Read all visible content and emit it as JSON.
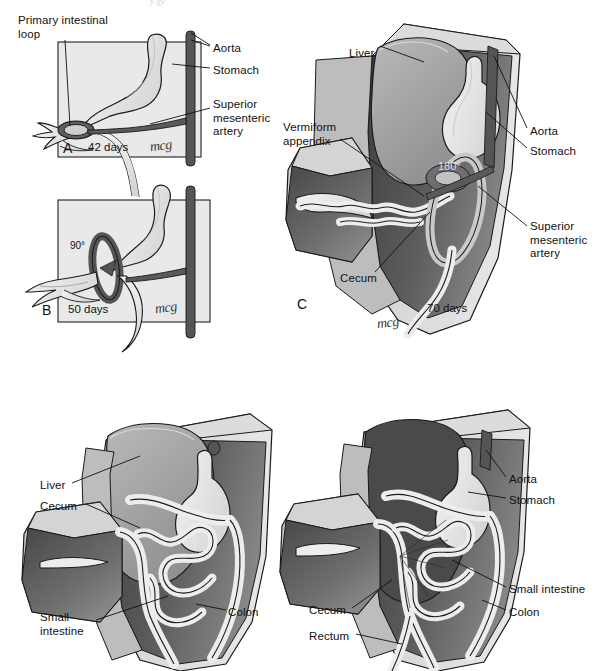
{
  "figure": {
    "signature": "mcg",
    "top_crop_artifact": "y gy"
  },
  "colors": {
    "page_background": "#ffffff",
    "box_fill": "#e9e9e9",
    "box_border": "#222222",
    "body_wall": "#d6d6d6",
    "body_wall_light": "#e2e2e2",
    "cavity_dark": "#4d4d4d",
    "cavity_mid": "#707070",
    "organ_pale": "#ededed",
    "organ_shade": "#c9c9c9",
    "aorta": "#555555",
    "artery": "#5a5a5a",
    "outline": "#1a1a1a",
    "leader_line": "#111111",
    "text": "#111111"
  },
  "panels": [
    {
      "id": "A",
      "letter": "A",
      "age": "42 days",
      "signature": "mcg",
      "labels": [
        {
          "name": "primary-intestinal-loop",
          "text": "Primary intestinal\nloop",
          "x": 18,
          "y": 14,
          "align": "left"
        },
        {
          "name": "aorta",
          "text": "Aorta",
          "x": 213,
          "y": 42,
          "align": "left"
        },
        {
          "name": "stomach",
          "text": "Stomach",
          "x": 213,
          "y": 64,
          "align": "left"
        },
        {
          "name": "superior-mesenteric-artery",
          "text": "Superior\nmesenteric\nartery",
          "x": 213,
          "y": 98,
          "align": "left"
        }
      ]
    },
    {
      "id": "B",
      "letter": "B",
      "age": "50 days",
      "rotation": "90°",
      "signature": "mcg",
      "labels": []
    },
    {
      "id": "C",
      "letter": "C",
      "age": "70 days",
      "rotation": "180°",
      "signature": "mcg",
      "labels": [
        {
          "name": "liver",
          "text": "Liver",
          "x": 349,
          "y": 47,
          "align": "left"
        },
        {
          "name": "vermiform-appendix",
          "text": "Vermiform\nappendix",
          "x": 283,
          "y": 121,
          "align": "left"
        },
        {
          "name": "cecum",
          "text": "Cecum",
          "x": 340,
          "y": 272,
          "align": "left"
        },
        {
          "name": "aorta",
          "text": "Aorta",
          "x": 530,
          "y": 125,
          "align": "left"
        },
        {
          "name": "stomach",
          "text": "Stomach",
          "x": 530,
          "y": 145,
          "align": "left"
        },
        {
          "name": "superior-mesenteric-artery",
          "text": "Superior\nmesenteric\nartery",
          "x": 530,
          "y": 220,
          "align": "left"
        }
      ]
    },
    {
      "id": "D",
      "letter": "",
      "age": "",
      "signature": "",
      "labels": [
        {
          "name": "liver",
          "text": "Liver",
          "x": 40,
          "y": 479,
          "align": "left"
        },
        {
          "name": "cecum",
          "text": "Cecum",
          "x": 40,
          "y": 500,
          "align": "left"
        },
        {
          "name": "small-intestine",
          "text": "Small\nintestine",
          "x": 40,
          "y": 611,
          "align": "left"
        },
        {
          "name": "colon",
          "text": "Colon",
          "x": 228,
          "y": 606,
          "align": "left"
        }
      ]
    },
    {
      "id": "E",
      "letter": "",
      "age": "",
      "signature": "",
      "labels": [
        {
          "name": "aorta",
          "text": "Aorta",
          "x": 509,
          "y": 473,
          "align": "left"
        },
        {
          "name": "stomach",
          "text": "Stomach",
          "x": 509,
          "y": 494,
          "align": "left"
        },
        {
          "name": "small-intestine",
          "text": "Small intestine",
          "x": 509,
          "y": 583,
          "align": "left"
        },
        {
          "name": "colon",
          "text": "Colon",
          "x": 509,
          "y": 606,
          "align": "left"
        },
        {
          "name": "cecum",
          "text": "Cecum",
          "x": 309,
          "y": 604,
          "align": "left"
        },
        {
          "name": "rectum",
          "text": "Rectum",
          "x": 309,
          "y": 630,
          "align": "left"
        }
      ]
    }
  ]
}
